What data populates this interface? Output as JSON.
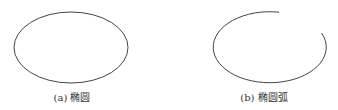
{
  "figures": [
    {
      "id": "a",
      "caption": "(a) 椭圆",
      "shape": "ellipse",
      "center": [
        71,
        47.5
      ],
      "rx": 57,
      "ry": 35.5
    },
    {
      "id": "b",
      "caption": "(b) 椭圆弧",
      "shape": "elliptical-arc",
      "center": [
        268.5,
        47.5
      ],
      "rx": 56.5,
      "ry": 35.5
    }
  ],
  "colors": {
    "stroke": "#444444",
    "text": "#333333",
    "background": "#ffffff"
  }
}
